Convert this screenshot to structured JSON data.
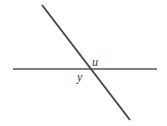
{
  "figure": {
    "type": "two-intersecting-lines-angle-diagram",
    "background_color": "#ffffff",
    "width": 167,
    "height": 126,
    "lines": [
      {
        "name": "horizontal-line",
        "x1": 13,
        "y1": 69,
        "x2": 157,
        "y2": 69,
        "color": "#7f7f7f",
        "stroke_width": 2
      },
      {
        "name": "transversal-line",
        "x1": 42,
        "y1": 5,
        "x2": 130,
        "y2": 120,
        "color": "#4a4a4a",
        "stroke_width": 2
      }
    ],
    "intersection": {
      "name": "intersection-point",
      "x": 88,
      "y": 69
    },
    "labels": [
      {
        "id": "u",
        "text": "u",
        "name": "angle-label-u",
        "position": "above-right-of-intersection",
        "x": 92,
        "y": 56,
        "color": "#3a3a3a",
        "style": "italic"
      },
      {
        "id": "y",
        "text": "y",
        "name": "angle-label-y",
        "position": "below-left-of-intersection",
        "x": 77,
        "y": 71,
        "color": "#3a3a3a",
        "style": "italic"
      }
    ]
  }
}
